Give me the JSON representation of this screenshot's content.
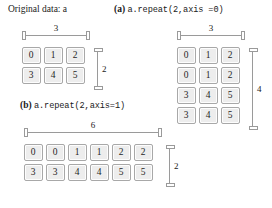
{
  "figure": {
    "background": "#ffffff",
    "cell_fill": "#ededed",
    "cell_border": "#a8a8a8",
    "dim_line_color": "#9a9a9a"
  },
  "panels": [
    {
      "id": "original",
      "caption_plain": "Original data: a",
      "caption_label": "",
      "caption_code": "",
      "width_label": "3",
      "height_label": "2",
      "rows": [
        [
          "0",
          "1",
          "2"
        ],
        [
          "3",
          "4",
          "5"
        ]
      ]
    },
    {
      "id": "repeat-axis0",
      "caption_plain": "",
      "caption_label": "(a)",
      "caption_code": "a.repeat(2,axis =0)",
      "width_label": "3",
      "height_label": "4",
      "rows": [
        [
          "0",
          "1",
          "2"
        ],
        [
          "0",
          "1",
          "2"
        ],
        [
          "3",
          "4",
          "5"
        ],
        [
          "3",
          "4",
          "5"
        ]
      ]
    },
    {
      "id": "repeat-axis1",
      "caption_plain": "",
      "caption_label": "(b)",
      "caption_code": "a.repeat(2,axis=1)",
      "width_label": "6",
      "height_label": "2",
      "rows": [
        [
          "0",
          "0",
          "1",
          "1",
          "2",
          "2"
        ],
        [
          "3",
          "3",
          "4",
          "4",
          "5",
          "5"
        ]
      ]
    }
  ]
}
